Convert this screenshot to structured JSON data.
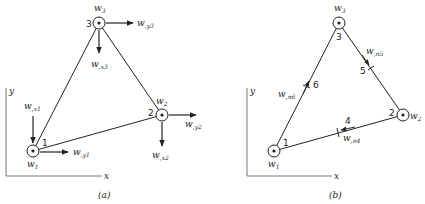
{
  "panel_a": {
    "caption": "(a)",
    "axis_x": "x",
    "axis_y": "y",
    "nodes": [
      {
        "num": "1",
        "w": "w",
        "wsub": "1",
        "dof_x": "w",
        "dof_x_sub": ",x1",
        "dof_y": "w",
        "dof_y_sub": ",y1"
      },
      {
        "num": "2",
        "w": "w",
        "wsub": "2",
        "dof_x": "w",
        "dof_x_sub": ",x2",
        "dof_y": "w",
        "dof_y_sub": ",y2"
      },
      {
        "num": "3",
        "w": "w",
        "wsub": "3",
        "dof_x": "w",
        "dof_x_sub": ",x3",
        "dof_y": "w",
        "dof_y_sub": ",y3"
      }
    ]
  },
  "panel_b": {
    "caption": "(b)",
    "axis_x": "x",
    "axis_y": "y",
    "nodes": [
      {
        "num": "1",
        "w": "w",
        "wsub": "1"
      },
      {
        "num": "2",
        "w": "w",
        "wsub": "2"
      },
      {
        "num": "3",
        "w": "w",
        "wsub": "3"
      }
    ],
    "midside": [
      {
        "num": "4",
        "label": "w",
        "sub": ",n4"
      },
      {
        "num": "5",
        "label": "w",
        "sub": ",n5"
      },
      {
        "num": "6",
        "label": "w",
        "sub": ",n6"
      }
    ]
  }
}
